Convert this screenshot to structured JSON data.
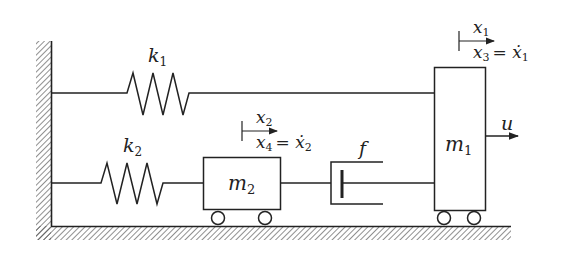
{
  "diagram": {
    "type": "mass-spring-damper system",
    "labels": {
      "k1": "k",
      "k1_sub": "1",
      "k2": "k",
      "k2_sub": "2",
      "m1": "m",
      "m1_sub": "1",
      "m2": "m",
      "m2_sub": "2",
      "f": "f",
      "u": "u",
      "x1": "x",
      "x1_sub": "1",
      "x3_eq": "x",
      "x3_sub": "3",
      "x3_rhs": "= ẋ",
      "x3_rhs_sub": "1",
      "x2": "x",
      "x2_sub": "2",
      "x4_eq": "x",
      "x4_sub": "4",
      "x4_rhs": "= ẋ",
      "x4_rhs_sub": "2"
    },
    "components": [
      {
        "id": "wall",
        "kind": "fixed-wall"
      },
      {
        "id": "ground",
        "kind": "floor"
      },
      {
        "id": "k1",
        "kind": "spring",
        "from": "wall",
        "to": "m1"
      },
      {
        "id": "k2",
        "kind": "spring",
        "from": "wall",
        "to": "m2"
      },
      {
        "id": "f",
        "kind": "damper",
        "from": "m2",
        "to": "m1"
      },
      {
        "id": "m1",
        "kind": "mass-cart"
      },
      {
        "id": "m2",
        "kind": "mass-cart"
      },
      {
        "id": "u",
        "kind": "input-force",
        "on": "m1"
      }
    ],
    "colors": {
      "stroke": "#222222",
      "background": "#ffffff"
    }
  }
}
